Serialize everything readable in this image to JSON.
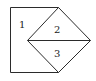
{
  "diagram": {
    "labels": {
      "region1": "1",
      "region2": "2",
      "region3": "3"
    },
    "colors": {
      "stroke": "#2b2b2b",
      "background": "#ffffff"
    }
  }
}
